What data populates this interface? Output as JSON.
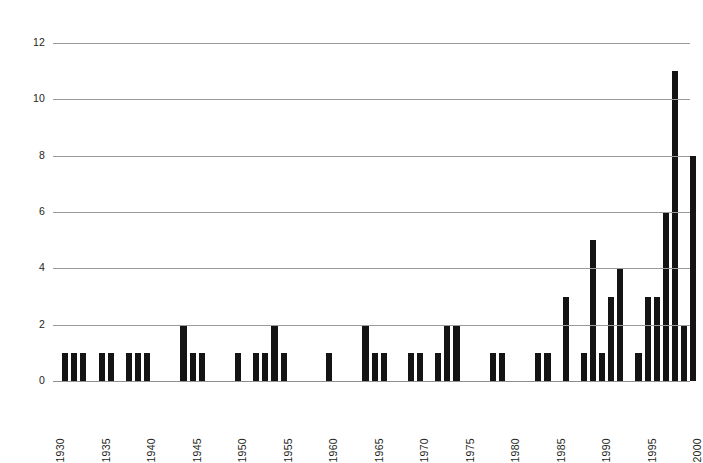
{
  "chart_data": {
    "type": "bar",
    "title": "",
    "subtitle": "",
    "xlabel": "",
    "ylabel": "",
    "xlim": [
      1930,
      2000
    ],
    "ylim": [
      0,
      12
    ],
    "y_ticks": [
      0,
      2,
      4,
      6,
      8,
      10,
      12
    ],
    "x_ticks": [
      1930,
      1935,
      1940,
      1945,
      1950,
      1955,
      1960,
      1965,
      1970,
      1975,
      1980,
      1985,
      1990,
      1995,
      2000
    ],
    "grid": "horizontal",
    "legend": "none",
    "bar_color": "#141414",
    "grid_color": "#9a9a9a",
    "axis_text_color": "#231f20",
    "background_color": "#ffffff",
    "categories": [
      1930,
      1931,
      1932,
      1933,
      1934,
      1935,
      1936,
      1937,
      1938,
      1939,
      1940,
      1941,
      1942,
      1943,
      1944,
      1945,
      1946,
      1947,
      1948,
      1949,
      1950,
      1951,
      1952,
      1953,
      1954,
      1955,
      1956,
      1957,
      1958,
      1959,
      1960,
      1961,
      1962,
      1963,
      1964,
      1965,
      1966,
      1967,
      1968,
      1969,
      1970,
      1971,
      1972,
      1973,
      1974,
      1975,
      1976,
      1977,
      1978,
      1979,
      1980,
      1981,
      1982,
      1983,
      1984,
      1985,
      1986,
      1987,
      1988,
      1989,
      1990,
      1991,
      1992,
      1993,
      1994,
      1995,
      1996,
      1997,
      1998,
      1999,
      2000
    ],
    "values": [
      0,
      1,
      1,
      1,
      0,
      1,
      1,
      0,
      1,
      1,
      1,
      0,
      0,
      0,
      2,
      1,
      1,
      0,
      0,
      0,
      1,
      0,
      1,
      1,
      2,
      1,
      0,
      0,
      0,
      0,
      1,
      0,
      0,
      0,
      2,
      1,
      1,
      0,
      0,
      1,
      1,
      0,
      1,
      2,
      2,
      0,
      0,
      0,
      1,
      1,
      0,
      0,
      0,
      1,
      1,
      0,
      3,
      0,
      1,
      5,
      1,
      3,
      4,
      0,
      1,
      3,
      3,
      6,
      11,
      2,
      8
    ]
  },
  "y_tick_labels": [
    "12",
    "10",
    "8",
    "6",
    "4",
    "2",
    "0"
  ],
  "x_tick_labels": [
    "1930",
    "1935",
    "1940",
    "1945",
    "1950",
    "1955",
    "1960",
    "1965",
    "1970",
    "1975",
    "1980",
    "1985",
    "1990",
    "1995",
    "2000"
  ]
}
